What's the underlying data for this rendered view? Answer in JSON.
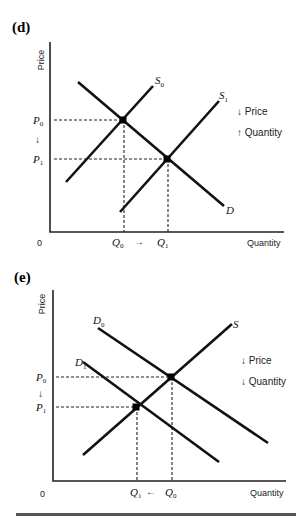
{
  "panels": [
    {
      "id": "d",
      "label": "(d)",
      "y_axis_label": "Price",
      "x_axis_label": "Quantity",
      "origin_label": "0",
      "curves": [
        {
          "name": "S0",
          "label": "S",
          "sub": "0"
        },
        {
          "name": "S1",
          "label": "S",
          "sub": "1"
        },
        {
          "name": "D",
          "label": "D",
          "sub": ""
        }
      ],
      "price_labels": [
        {
          "label": "P",
          "sub": "0"
        },
        {
          "label": "P",
          "sub": "1"
        }
      ],
      "price_arrow": "↓",
      "quantity_labels": [
        {
          "label": "Q",
          "sub": "0"
        },
        {
          "label": "Q",
          "sub": "1"
        }
      ],
      "quantity_arrow": "→",
      "notes": [
        "↓ Price",
        "↑ Quantity"
      ]
    },
    {
      "id": "e",
      "label": "(e)",
      "y_axis_label": "Price",
      "x_axis_label": "Quantity",
      "origin_label": "0",
      "curves": [
        {
          "name": "D0",
          "label": "D",
          "sub": "0"
        },
        {
          "name": "D1",
          "label": "D",
          "sub": "1"
        },
        {
          "name": "S",
          "label": "S",
          "sub": ""
        }
      ],
      "price_labels": [
        {
          "label": "P",
          "sub": "0"
        },
        {
          "label": "P",
          "sub": "1"
        }
      ],
      "price_arrow": "↓",
      "quantity_labels": [
        {
          "label": "Q",
          "sub": "1"
        },
        {
          "label": "Q",
          "sub": "0"
        }
      ],
      "quantity_arrow": "←",
      "notes": [
        "↓ Price",
        "↓ Quantity"
      ]
    }
  ]
}
